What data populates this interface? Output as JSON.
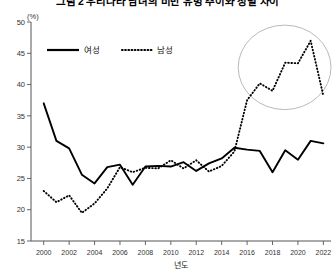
{
  "header": {
    "title": "그림 2  우리나라 남녀의 비만 유병 추이와 성별 차이"
  },
  "axes": {
    "y_unit": "(%)",
    "y_ticks": [
      50,
      45,
      40,
      35,
      30,
      25,
      20,
      15
    ],
    "x_ticks": [
      2000,
      2002,
      2004,
      2006,
      2008,
      2010,
      2012,
      2014,
      2016,
      2018,
      2020,
      2022
    ],
    "x_title": "년도"
  },
  "legend": {
    "items": [
      {
        "label": "여성",
        "style": "solid"
      },
      {
        "label": "남성",
        "style": "dotted"
      }
    ]
  },
  "annotation": {
    "highlight_label": "남성 급증 구간 강조 타원"
  },
  "chart_data": {
    "type": "line",
    "title": "그림 2  우리나라 남녀의 비만 유병 추이와 성별 차이",
    "xlabel": "년도",
    "ylabel": "(%)",
    "xlim": [
      1999,
      2022.6
    ],
    "ylim": [
      15,
      50
    ],
    "yticks": [
      15,
      20,
      25,
      30,
      35,
      40,
      45,
      50
    ],
    "xticks": [
      2000,
      2002,
      2004,
      2006,
      2008,
      2010,
      2012,
      2014,
      2016,
      2018,
      2020,
      2022
    ],
    "grid": false,
    "legend_position": "top-left-inside",
    "x": [
      2000,
      2001,
      2002,
      2003,
      2004,
      2005,
      2006,
      2007,
      2008,
      2009,
      2010,
      2011,
      2012,
      2013,
      2014,
      2015,
      2016,
      2017,
      2018,
      2019,
      2020,
      2021,
      2022
    ],
    "series": [
      {
        "name": "여성",
        "style": "solid",
        "values": [
          37.0,
          31.0,
          29.8,
          25.6,
          24.2,
          26.8,
          27.2,
          24.0,
          26.9,
          27.0,
          26.9,
          27.6,
          26.2,
          27.4,
          28.2,
          29.9,
          29.6,
          29.4,
          26.0,
          29.5,
          28.0,
          31.0,
          30.6
        ]
      },
      {
        "name": "남성",
        "style": "dotted",
        "values": [
          23.0,
          21.2,
          22.3,
          19.5,
          21.0,
          23.4,
          26.8,
          26.0,
          26.7,
          26.6,
          27.9,
          26.6,
          27.9,
          26.1,
          27.0,
          29.3,
          37.5,
          40.2,
          39.0,
          43.5,
          43.4,
          47.0,
          38.2
        ]
      }
    ],
    "annotations": [
      {
        "type": "ellipse",
        "note": "남성 급증 구간 강조",
        "x_range": [
          2015.3,
          2022.6
        ],
        "y_range": [
          36.0,
          49.5
        ]
      }
    ]
  }
}
